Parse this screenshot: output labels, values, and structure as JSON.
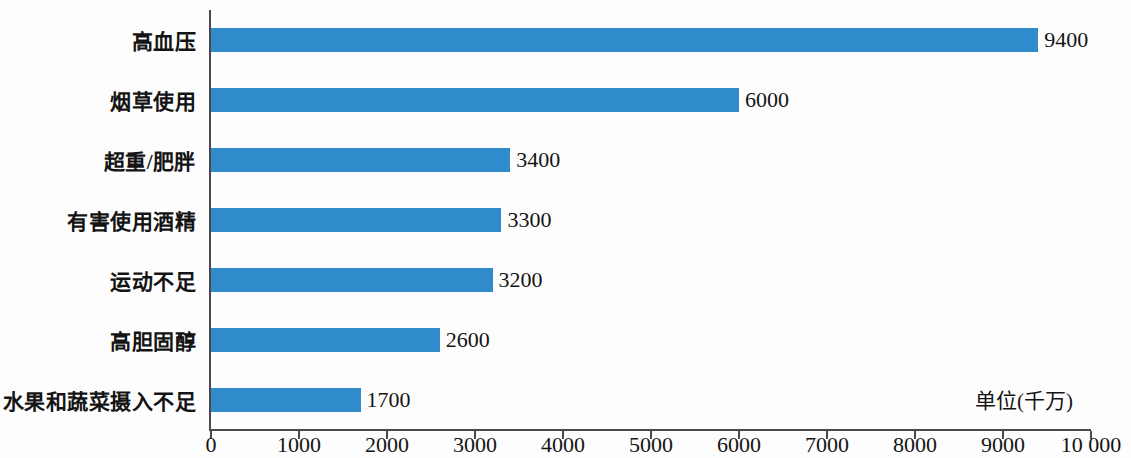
{
  "chart_data": {
    "type": "bar",
    "orientation": "horizontal",
    "title": "",
    "subtitle": "",
    "xlabel": "",
    "ylabel": "",
    "unit_annotation": "单位(千万)",
    "categories": [
      "高血压",
      "烟草使用",
      "超重/肥胖",
      "有害使用酒精",
      "运动不足",
      "高胆固醇",
      "水果和蔬菜摄入不足"
    ],
    "values": [
      9400,
      6000,
      3400,
      3300,
      3200,
      2600,
      1700
    ],
    "value_labels": [
      "9400",
      "6000",
      "3400",
      "3300",
      "3200",
      "2600",
      "1700"
    ],
    "xlim": [
      0,
      10000
    ],
    "xticks": [
      0,
      1000,
      2000,
      3000,
      4000,
      5000,
      6000,
      7000,
      8000,
      9000,
      10000
    ],
    "xtick_labels": [
      "0",
      "1000",
      "2000",
      "3000",
      "4000",
      "5000",
      "6000",
      "7000",
      "8000",
      "9000",
      "10 000"
    ],
    "grid": false,
    "legend": false,
    "bar_color": "#2f8bcc",
    "axis_color": "#4a4a4a",
    "background_color": "#fdfdfd"
  }
}
